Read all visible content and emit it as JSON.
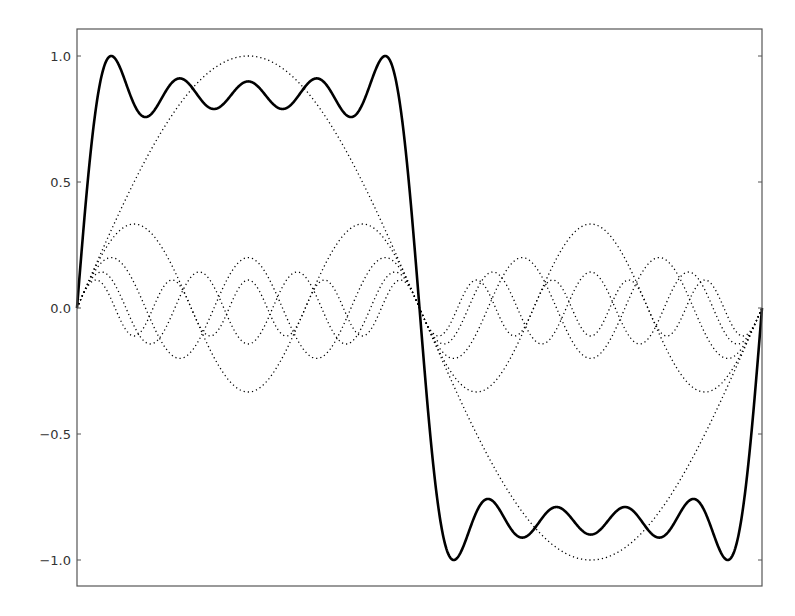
{
  "chart_data": {
    "type": "line",
    "title": "",
    "xlabel": "",
    "ylabel": "",
    "x_range": [
      0,
      6.283185307
    ],
    "ylim": [
      -1.1,
      1.1
    ],
    "grid": false,
    "legend": null,
    "x_ticks": [],
    "y_ticks": [
      {
        "value": 1.0,
        "label": "1.0"
      },
      {
        "value": 0.5,
        "label": "0.5"
      },
      {
        "value": 0.0,
        "label": "0.0"
      },
      {
        "value": -0.5,
        "label": "−0.5"
      },
      {
        "value": -1.0,
        "label": "−1.0"
      }
    ],
    "series": [
      {
        "name": "sin(x)",
        "harmonic": 1,
        "amplitude": 1.0,
        "style": "dotted"
      },
      {
        "name": "sin(3x)/3",
        "harmonic": 3,
        "amplitude": 0.3333,
        "style": "dotted"
      },
      {
        "name": "sin(5x)/5",
        "harmonic": 5,
        "amplitude": 0.2,
        "style": "dotted"
      },
      {
        "name": "sin(7x)/7",
        "harmonic": 7,
        "amplitude": 0.1429,
        "style": "dotted"
      },
      {
        "name": "sin(9x)/9",
        "harmonic": 9,
        "amplitude": 0.1111,
        "style": "dotted"
      },
      {
        "name": "partial sum (scaled)",
        "harmonics": [
          1,
          3,
          5,
          7,
          9
        ],
        "style": "solid",
        "peak_value": 1.0,
        "samples": {
          "x": [
            0.0,
            0.2,
            0.4,
            0.79,
            1.18,
            1.57,
            1.96,
            2.36,
            2.75,
            2.95,
            3.14
          ],
          "y": [
            0.0,
            0.93,
            0.85,
            0.86,
            0.85,
            0.8,
            0.85,
            0.86,
            0.85,
            0.93,
            0.0
          ]
        }
      }
    ],
    "colors": {
      "lines": "#000000",
      "frame": "#555555",
      "labels": "#333333"
    }
  },
  "axes": {
    "frame": {
      "left": 77,
      "top": 29,
      "right": 762,
      "bottom": 586
    }
  }
}
